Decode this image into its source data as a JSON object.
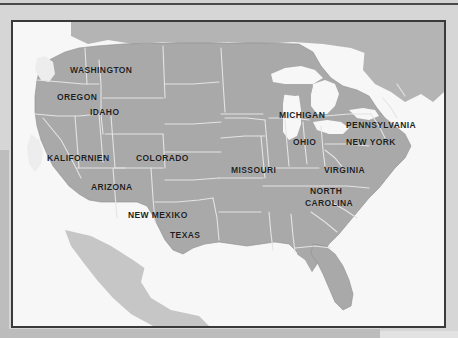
{
  "figure": {
    "kind": "map-figure",
    "region": "United States",
    "frame_color": "#3a3a3a",
    "page_background": "#d6d6d6",
    "water_color": "#f7f7f7",
    "land_color": "#a9a9a9",
    "state_border_color": "#e2e2e2",
    "label_color": "#1d1d1d"
  },
  "labels": [
    {
      "name": "washington",
      "text": "WASHINGTON",
      "x": 57,
      "y": 43
    },
    {
      "name": "oregon",
      "text": "OREGON",
      "x": 44,
      "y": 70
    },
    {
      "name": "idaho",
      "text": "IDAHO",
      "x": 77,
      "y": 85
    },
    {
      "name": "kalifornien",
      "text": "KALIFORNIEN",
      "x": 34,
      "y": 131
    },
    {
      "name": "colorado",
      "text": "COLORADO",
      "x": 123,
      "y": 131
    },
    {
      "name": "arizona",
      "text": "ARIZONA",
      "x": 78,
      "y": 160
    },
    {
      "name": "new-mexiko",
      "text": "NEW MEXIKO",
      "x": 115,
      "y": 188
    },
    {
      "name": "texas",
      "text": "TEXAS",
      "x": 157,
      "y": 208
    },
    {
      "name": "missouri",
      "text": "MISSOURI",
      "x": 218,
      "y": 143
    },
    {
      "name": "michigan",
      "text": "MICHIGAN",
      "x": 266,
      "y": 88
    },
    {
      "name": "ohio",
      "text": "OHIO",
      "x": 280,
      "y": 115
    },
    {
      "name": "pennsylvania",
      "text": "PENNSYLVANIA",
      "x": 333,
      "y": 98
    },
    {
      "name": "new-york",
      "text": "NEW YORK",
      "x": 333,
      "y": 115
    },
    {
      "name": "virginia",
      "text": "VIRGINIA",
      "x": 311,
      "y": 143
    },
    {
      "name": "north-carolina",
      "text": "NORTH",
      "x": 297,
      "y": 164
    },
    {
      "name": "north-carolina-2",
      "text": "CAROLINA",
      "x": 292,
      "y": 176
    }
  ],
  "geography": {
    "land_mass_label": "contiguous-united-states",
    "great_lakes_label": "great-lakes",
    "gulf_label": "gulf-of-mexico",
    "note": "Greyscale scanned reference map of the United States with selected states named in German orthography."
  }
}
